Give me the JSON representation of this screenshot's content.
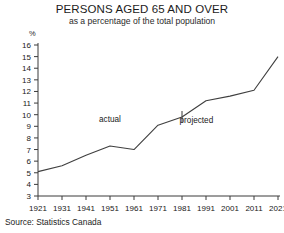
{
  "chart_data": {
    "type": "line",
    "title": "PERSONS AGED 65 AND OVER",
    "subtitle": "as a percentage of the total population",
    "xlabel": "",
    "ylabel": "%",
    "yunit": "%",
    "source": "Source: Statistics Canada",
    "x": [
      1921,
      1931,
      1941,
      1951,
      1961,
      1971,
      1981,
      1991,
      2001,
      2011,
      2021
    ],
    "categories": [
      "1921",
      "1931",
      "1941",
      "1951",
      "1961",
      "1971",
      "1981",
      "1991",
      "2001",
      "2011",
      "2021"
    ],
    "values": [
      5.1,
      5.6,
      6.5,
      7.3,
      7.0,
      9.1,
      9.8,
      11.2,
      11.6,
      12.1,
      15.0
    ],
    "series": [
      {
        "name": "Persons aged 65 and over (% of total population)",
        "values": [
          5.1,
          5.6,
          6.5,
          7.3,
          7.0,
          9.1,
          9.8,
          11.2,
          11.6,
          12.1,
          15.0
        ]
      }
    ],
    "ylim": [
      3,
      16
    ],
    "yticks": [
      3,
      4,
      5,
      6,
      7,
      8,
      9,
      10,
      11,
      12,
      13,
      14,
      15,
      16
    ],
    "ytick_labels": [
      "3",
      "4",
      "5",
      "6",
      "7",
      "8",
      "9",
      "10",
      "11",
      "12",
      "13",
      "14",
      "15",
      "16"
    ],
    "xlim": [
      1921,
      2021
    ],
    "xticks": [
      1921,
      1931,
      1941,
      1951,
      1961,
      1971,
      1981,
      1991,
      2001,
      2011,
      2021
    ],
    "grid": false,
    "legend": "none",
    "annotations": [
      {
        "text": "actual",
        "x": 1951,
        "y": 9.4
      },
      {
        "text": "projected",
        "x": 1987,
        "y": 9.3
      }
    ],
    "divider": {
      "x": 1981,
      "label": "actual/projected boundary"
    }
  }
}
